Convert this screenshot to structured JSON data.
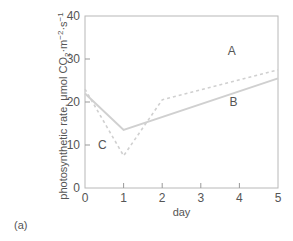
{
  "chart_data": {
    "type": "line",
    "title": "",
    "xlabel": "day",
    "ylabel": "photosynthetic rate, μmol CO₂·m⁻²·s⁻¹",
    "ylabel_parts": {
      "main": "photosynthetic rate, μmol CO",
      "sub": "2",
      "mid": "·m",
      "sup1": "−2",
      "mid2": "·s",
      "sup2": "−1"
    },
    "xlim": [
      0,
      5
    ],
    "ylim": [
      0,
      40
    ],
    "xticks": [
      0,
      1,
      2,
      3,
      4,
      5
    ],
    "yticks": [
      0,
      10,
      20,
      30,
      40
    ],
    "grid": false,
    "series": [
      {
        "name": "A",
        "style": "dashed",
        "x": [
          0,
          1,
          2,
          5
        ],
        "values": [
          23,
          7.5,
          20.5,
          27.5
        ]
      },
      {
        "name": "B",
        "style": "solid",
        "x": [
          0,
          1,
          5
        ],
        "values": [
          22,
          13.5,
          25.5
        ]
      }
    ],
    "annotations": [
      {
        "text": "A",
        "x": 3.8,
        "y": 31
      },
      {
        "text": "B",
        "x": 3.85,
        "y": 19
      },
      {
        "text": "C",
        "x": 0.45,
        "y": 9
      }
    ],
    "panel_label": "(a)"
  }
}
